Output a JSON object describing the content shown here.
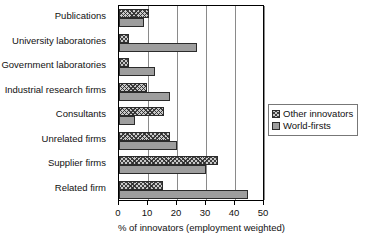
{
  "chart_data": {
    "type": "bar",
    "orientation": "horizontal",
    "title": "",
    "xlabel": "% of innovators (employment weighted)",
    "ylabel": "",
    "xlim": [
      0,
      50
    ],
    "xticks": [
      0,
      10,
      20,
      30,
      40,
      50
    ],
    "xtick_labels": [
      "0",
      "10",
      "20",
      "30",
      "40",
      "50"
    ],
    "grid": true,
    "grid_axis": "x",
    "legend_position": "right-middle",
    "categories": [
      "Publications",
      "University laboratories",
      "Government laboratories",
      "Industrial research firms",
      "Consultants",
      "Unrelated firms",
      "Supplier firms",
      "Related firm"
    ],
    "series": [
      {
        "name": "Other innovators",
        "pattern": "crosshatch",
        "color": "#c9c9c9",
        "values": [
          10.5,
          3.5,
          3.5,
          9.5,
          15.5,
          17.5,
          34.0,
          15.0
        ]
      },
      {
        "name": "World-firsts",
        "pattern": "solid",
        "color": "#9e9e9e",
        "values": [
          8.5,
          27.0,
          12.5,
          17.5,
          5.5,
          20.0,
          30.0,
          44.5
        ]
      }
    ]
  },
  "legend": {
    "items": [
      {
        "label": "Other innovators"
      },
      {
        "label": "World-firsts"
      }
    ]
  },
  "colors": {
    "other_innovators": "#c9c9c9",
    "world_firsts": "#9e9e9e",
    "bar_outline": "#2b2b2b",
    "gridline": "#8a8a8a",
    "axis": "#000000",
    "text": "#111111",
    "background": "#ffffff"
  }
}
